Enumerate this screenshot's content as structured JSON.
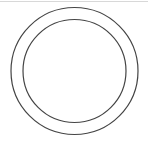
{
  "diagram": {
    "type": "concentric-circles",
    "stroke_color": "#444444",
    "rule_color": "#d8d8d8",
    "outer_circle": {
      "cx": 74.5,
      "cy": 71,
      "r": 63.5
    },
    "inner_circle": {
      "cx": 74.5,
      "cy": 71,
      "r": 51.5
    }
  }
}
